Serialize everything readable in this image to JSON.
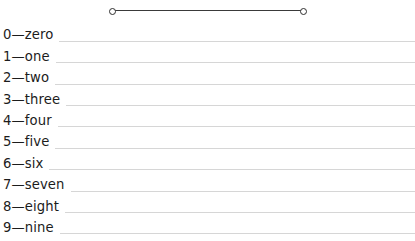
{
  "page": {
    "background_color": "#ffffff",
    "width": 415,
    "height": 241
  },
  "connector": {
    "name": "horizontal-connector",
    "line_color": "#3a3a3a",
    "node_fill": "#ffffff",
    "node_stroke": "#2e2e2e",
    "left_node_x": 112,
    "right_node_x": 303,
    "y": 11,
    "length": 191
  },
  "list": {
    "rule_color": "#d6d6d6",
    "text_color": "#1c1c1c",
    "separator": "—",
    "rows": [
      {
        "number": "0",
        "word": "zero",
        "label": "0—zero"
      },
      {
        "number": "1",
        "word": "one",
        "label": "1—one"
      },
      {
        "number": "2",
        "word": "two",
        "label": "2—two"
      },
      {
        "number": "3",
        "word": "three",
        "label": "3—three"
      },
      {
        "number": "4",
        "word": "four",
        "label": "4—four"
      },
      {
        "number": "5",
        "word": "five",
        "label": "5—five"
      },
      {
        "number": "6",
        "word": "six",
        "label": "6—six"
      },
      {
        "number": "7",
        "word": "seven",
        "label": "7—seven"
      },
      {
        "number": "8",
        "word": "eight",
        "label": "8—eight"
      },
      {
        "number": "9",
        "word": "nine",
        "label": "9—nine"
      }
    ]
  }
}
